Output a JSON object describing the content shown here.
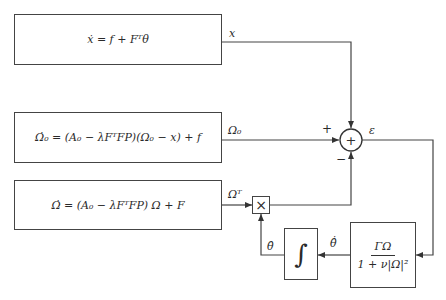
{
  "blocks": {
    "plant": {
      "equation": "ẋ = f + Fᵀθ"
    },
    "observer": {
      "equation": "Ω̇₀ = (A₀ − λFᵀFP)(Ω₀ − x) + f"
    },
    "filter": {
      "equation": "Ω̇ = (A₀ − λFᵀFP) Ω + F"
    },
    "gain": {
      "numerator": "ΓΩ",
      "denominator": "1 + ν|Ω|²"
    },
    "integrator": {
      "symbol": "∫"
    },
    "multiplier": {
      "symbol": "×"
    },
    "summer": {
      "symbol": "+"
    }
  },
  "signals": {
    "x": "x",
    "omega0": "Ω₀",
    "omegaT": "Ωᵀ",
    "epsilon": "ε",
    "theta_hat_dot": "θ̂̇",
    "theta_hat": "θ̂"
  },
  "signs": {
    "plus": "+",
    "minus": "−"
  },
  "colors": {
    "line": "#444444",
    "background": "#ffffff"
  }
}
